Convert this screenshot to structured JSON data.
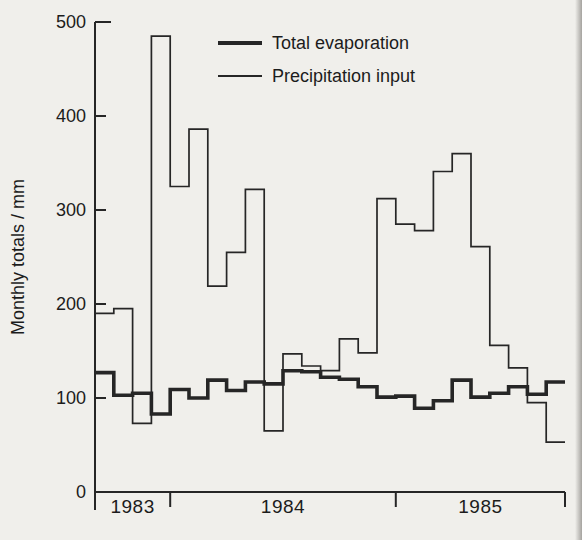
{
  "figure": {
    "ylabel": "Monthly totals / mm",
    "background_color": "#f0efeb",
    "line_color": "#262626",
    "legend": [
      {
        "label": "Total evaporation",
        "weight": "thick"
      },
      {
        "label": "Precipitation input",
        "weight": "thin"
      }
    ]
  },
  "chart_data": {
    "type": "line",
    "line_style": "step",
    "title": "",
    "xlabel": "",
    "ylabel": "Monthly totals / mm",
    "ylim": [
      0,
      500
    ],
    "yticks": [
      0,
      100,
      200,
      300,
      400,
      500
    ],
    "grid": false,
    "legend_position": "top-inside",
    "x_unit": "month",
    "n_months": 25,
    "years": [
      {
        "label": "1983",
        "start_month": 0,
        "end_month": 4
      },
      {
        "label": "1984",
        "start_month": 4,
        "end_month": 16
      },
      {
        "label": "1985",
        "start_month": 16,
        "end_month": 25
      }
    ],
    "series": [
      {
        "name": "Total evaporation",
        "style": "thick",
        "values": [
          127,
          103,
          105,
          83,
          109,
          100,
          119,
          108,
          117,
          115,
          129,
          128,
          122,
          120,
          112,
          101,
          102,
          89,
          97,
          119,
          101,
          105,
          112,
          104,
          117
        ]
      },
      {
        "name": "Precipitation input",
        "style": "thin",
        "values": [
          190,
          195,
          73,
          485,
          325,
          386,
          219,
          255,
          322,
          65,
          147,
          134,
          129,
          163,
          148,
          312,
          285,
          278,
          341,
          360,
          261,
          156,
          132,
          95,
          53
        ]
      }
    ]
  }
}
